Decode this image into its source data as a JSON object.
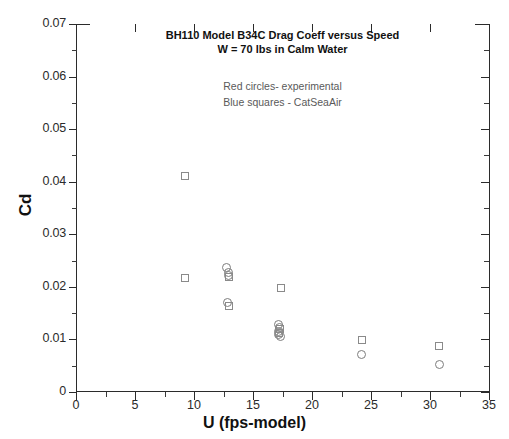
{
  "chart_data": {
    "type": "scatter",
    "title": "BH110  Model B34C  Drag Coeff versus Speed",
    "subtitle": "W = 70 lbs in Calm Water",
    "xlabel": "U (fps-model)",
    "ylabel": "Cd",
    "xlim": [
      0,
      35
    ],
    "ylim": [
      0,
      0.07
    ],
    "xticks": [
      "0",
      "5",
      "10",
      "15",
      "20",
      "25",
      "30",
      "35"
    ],
    "xtick_values": [
      0,
      5,
      10,
      15,
      20,
      25,
      30,
      35
    ],
    "yticks": [
      "0",
      "0.01",
      "0.02",
      "0.03",
      "0.04",
      "0.05",
      "0.06",
      "0.07"
    ],
    "ytick_values": [
      0,
      0.01,
      0.02,
      0.03,
      0.04,
      0.05,
      0.06,
      0.07
    ],
    "grid": false,
    "legend_position": "inside-top-center",
    "annotations": [
      "Red  circles- experimental",
      "Blue squares - CatSeaAir"
    ],
    "series": [
      {
        "name": "Red  circles- experimental",
        "marker": "circle",
        "color": "#7d7d7d",
        "points": [
          {
            "x": 12.75,
            "y": 0.0236
          },
          {
            "x": 12.95,
            "y": 0.0228
          },
          {
            "x": 12.9,
            "y": 0.0221
          },
          {
            "x": 12.85,
            "y": 0.017
          },
          {
            "x": 17.2,
            "y": 0.0128
          },
          {
            "x": 17.25,
            "y": 0.0122
          },
          {
            "x": 17.2,
            "y": 0.0116
          },
          {
            "x": 17.15,
            "y": 0.011
          },
          {
            "x": 17.3,
            "y": 0.0106
          },
          {
            "x": 24.2,
            "y": 0.0072
          },
          {
            "x": 30.8,
            "y": 0.0053
          }
        ]
      },
      {
        "name": "Blue squares - CatSeaAir",
        "marker": "square",
        "color": "#8a8a8a",
        "points": [
          {
            "x": 9.2,
            "y": 0.041
          },
          {
            "x": 9.2,
            "y": 0.0216
          },
          {
            "x": 12.95,
            "y": 0.0219
          },
          {
            "x": 12.95,
            "y": 0.0163
          },
          {
            "x": 17.35,
            "y": 0.0197
          },
          {
            "x": 17.25,
            "y": 0.0119
          },
          {
            "x": 17.2,
            "y": 0.0112
          },
          {
            "x": 24.2,
            "y": 0.0098
          },
          {
            "x": 30.8,
            "y": 0.0087
          }
        ]
      }
    ]
  },
  "axis": {
    "y_title": "Cd",
    "x_title": "U (fps-model)"
  }
}
